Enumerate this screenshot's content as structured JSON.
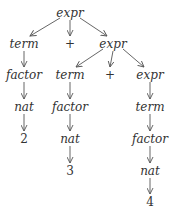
{
  "diagram": {
    "type": "parse-tree",
    "edge_color": "#555555",
    "text_color": "#333333",
    "nodes": [
      {
        "id": "n0",
        "label": "expr",
        "kind": "nonterminal",
        "x": 70,
        "y": 13
      },
      {
        "id": "n1",
        "label": "term",
        "kind": "nonterminal",
        "x": 24,
        "y": 44
      },
      {
        "id": "n2",
        "label": "+",
        "kind": "terminal",
        "x": 70,
        "y": 44
      },
      {
        "id": "n3",
        "label": "expr",
        "kind": "nonterminal",
        "x": 113,
        "y": 44
      },
      {
        "id": "n4",
        "label": "factor",
        "kind": "nonterminal",
        "x": 24,
        "y": 75
      },
      {
        "id": "n5",
        "label": "term",
        "kind": "nonterminal",
        "x": 70,
        "y": 75
      },
      {
        "id": "n6",
        "label": "+",
        "kind": "terminal",
        "x": 110,
        "y": 75
      },
      {
        "id": "n7",
        "label": "expr",
        "kind": "nonterminal",
        "x": 150,
        "y": 75
      },
      {
        "id": "n8",
        "label": "nat",
        "kind": "nonterminal",
        "x": 24,
        "y": 107
      },
      {
        "id": "n9",
        "label": "factor",
        "kind": "nonterminal",
        "x": 70,
        "y": 107
      },
      {
        "id": "n10",
        "label": "term",
        "kind": "nonterminal",
        "x": 150,
        "y": 107
      },
      {
        "id": "n11",
        "label": "2",
        "kind": "terminal",
        "x": 24,
        "y": 139
      },
      {
        "id": "n12",
        "label": "nat",
        "kind": "nonterminal",
        "x": 70,
        "y": 139
      },
      {
        "id": "n13",
        "label": "factor",
        "kind": "nonterminal",
        "x": 150,
        "y": 139
      },
      {
        "id": "n14",
        "label": "3",
        "kind": "terminal",
        "x": 70,
        "y": 171
      },
      {
        "id": "n15",
        "label": "nat",
        "kind": "nonterminal",
        "x": 150,
        "y": 171
      },
      {
        "id": "n16",
        "label": "4",
        "kind": "terminal",
        "x": 150,
        "y": 202
      }
    ],
    "edges": [
      [
        "n0",
        "n1"
      ],
      [
        "n0",
        "n2"
      ],
      [
        "n0",
        "n3"
      ],
      [
        "n1",
        "n4"
      ],
      [
        "n3",
        "n5"
      ],
      [
        "n3",
        "n6"
      ],
      [
        "n3",
        "n7"
      ],
      [
        "n4",
        "n8"
      ],
      [
        "n5",
        "n9"
      ],
      [
        "n7",
        "n10"
      ],
      [
        "n8",
        "n11"
      ],
      [
        "n9",
        "n12"
      ],
      [
        "n10",
        "n13"
      ],
      [
        "n12",
        "n14"
      ],
      [
        "n13",
        "n15"
      ],
      [
        "n15",
        "n16"
      ]
    ]
  }
}
